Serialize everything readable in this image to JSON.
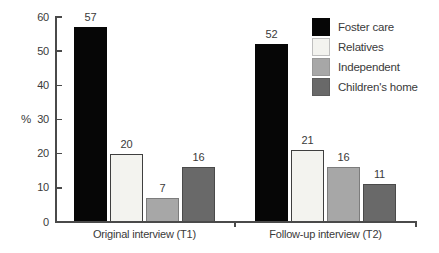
{
  "chart_data": {
    "type": "bar",
    "title": "",
    "ylabel": "%",
    "ylim": [
      0,
      60
    ],
    "yticks": [
      0,
      10,
      20,
      30,
      40,
      50,
      60
    ],
    "grid": false,
    "value_labels": true,
    "legend_position": "top-right",
    "categories": [
      "Original interview (T1)",
      "Follow-up interview (T2)"
    ],
    "series": [
      {
        "name": "Foster care",
        "values": [
          57,
          52
        ],
        "color": "#060606",
        "border": "#060606",
        "swatch_border": "#060606"
      },
      {
        "name": "Relatives",
        "values": [
          20,
          21
        ],
        "color": "#f3f3ef",
        "border": "#3f3f3f",
        "swatch_border": "#bfbfbf"
      },
      {
        "name": "Independent",
        "values": [
          7,
          16
        ],
        "color": "#a7a7a7",
        "border": "#7c7c7c",
        "swatch_border": "#979797"
      },
      {
        "name": "Children's home",
        "values": [
          16,
          11
        ],
        "color": "#696969",
        "border": "#4a4a4a",
        "swatch_border": "#5c5c5c"
      }
    ]
  },
  "colors": {
    "axis": "#4a4a4a",
    "text": "#3a3a3a",
    "background": "#ffffff"
  }
}
